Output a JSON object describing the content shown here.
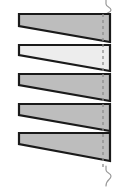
{
  "figure": {
    "background_color": "#ffffff",
    "width": 125,
    "height": 188
  },
  "style": {
    "outline_color": "#1a1a1a",
    "outline_width": 2.2,
    "fill_default": "#bdbdbd",
    "fill_highlight": "#ededed",
    "dash_color": "#8d8d8d",
    "break_color": "#9a9a9a"
  },
  "chart_data": {
    "type": "diagram",
    "xlabel": "",
    "ylabel": "",
    "items": [
      {
        "index": 1,
        "name": "wedge-1",
        "fill": "#bdbdbd",
        "highlighted": false,
        "left_x": 19,
        "right_x": 110,
        "top_y": 14,
        "left_thickness": 12,
        "right_thickness": 28,
        "taper_direction": "thicker-right"
      },
      {
        "index": 2,
        "name": "wedge-2",
        "fill": "#ededed",
        "highlighted": true,
        "left_x": 19,
        "right_x": 110,
        "top_y": 45,
        "left_thickness": 10,
        "right_thickness": 26,
        "taper_direction": "thicker-right"
      },
      {
        "index": 3,
        "name": "wedge-3",
        "fill": "#bdbdbd",
        "highlighted": false,
        "left_x": 19,
        "right_x": 110,
        "top_y": 74,
        "left_thickness": 11,
        "right_thickness": 27,
        "taper_direction": "thicker-right"
      },
      {
        "index": 4,
        "name": "wedge-4",
        "fill": "#bdbdbd",
        "highlighted": false,
        "left_x": 19,
        "right_x": 110,
        "top_y": 104,
        "left_thickness": 11,
        "right_thickness": 27,
        "taper_direction": "thicker-right"
      },
      {
        "index": 5,
        "name": "wedge-5",
        "fill": "#bdbdbd",
        "highlighted": false,
        "left_x": 19,
        "right_x": 110,
        "top_y": 133,
        "left_thickness": 11,
        "right_thickness": 28,
        "taper_direction": "thicker-right"
      }
    ],
    "annotations": [
      {
        "name": "centerline-dashed",
        "type": "dashed-vertical-line",
        "x": 103,
        "y_start": 14,
        "y_end": 167,
        "color": "#8d8d8d"
      },
      {
        "name": "break-line-top",
        "type": "s-break",
        "x": 106,
        "y_start": 0,
        "y_end": 14,
        "color": "#9a9a9a"
      },
      {
        "name": "break-line-bottom",
        "type": "s-break",
        "x": 106,
        "y_start": 167,
        "y_end": 186,
        "color": "#9a9a9a"
      }
    ],
    "count": 5,
    "legend": []
  }
}
